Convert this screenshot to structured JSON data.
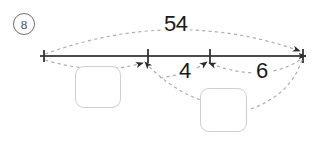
{
  "item": {
    "number": "8"
  },
  "diagram": {
    "type": "number-line-part-whole",
    "total_label": "54",
    "left_segment_label": "4",
    "right_segment_label": "6",
    "answer_box_1_value": "",
    "answer_box_2_value": "",
    "line_color": "#4d4d4d",
    "dash_color": "#b3b3b3",
    "box_border_color": "#cfcfcf",
    "text_color": "#1a1a1a",
    "tick_positions_px": [
      44,
      148,
      210,
      303
    ],
    "line_y_px": 56
  }
}
